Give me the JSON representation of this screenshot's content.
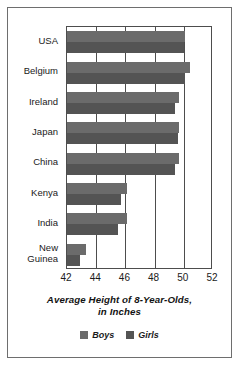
{
  "chart_data": {
    "type": "bar",
    "orientation": "horizontal",
    "title": "Average Height of 8-Year-Olds, in Inches",
    "title_line1": "Average Height of 8-Year-Olds,",
    "title_line2": "in Inches",
    "xlabel": "",
    "ylabel": "",
    "xlim": [
      42,
      52
    ],
    "xticks": [
      42,
      44,
      46,
      48,
      50,
      52
    ],
    "xtick_labels": [
      "42",
      "44",
      "46",
      "48",
      "50",
      "52"
    ],
    "grid": true,
    "grid_axis": "x",
    "legend_position": "bottom",
    "categories": [
      "USA",
      "Belgium",
      "Ireland",
      "Japan",
      "China",
      "Kenya",
      "India",
      "New\nGuinea"
    ],
    "category_labels": [
      "USA",
      "Belgium",
      "Ireland",
      "Japan",
      "China",
      "Kenya",
      "India",
      "New Guinea"
    ],
    "series": [
      {
        "name": "Boys",
        "color": "#6b6b6b",
        "values": [
          50.1,
          50.4,
          49.7,
          49.7,
          49.7,
          46.1,
          46.1,
          43.3
        ]
      },
      {
        "name": "Girls",
        "color": "#545454",
        "values": [
          50.0,
          50.1,
          49.4,
          49.6,
          49.4,
          45.7,
          45.5,
          42.9
        ]
      }
    ]
  },
  "legend": {
    "items": [
      {
        "label": "Boys",
        "color": "#6b6b6b"
      },
      {
        "label": "Girls",
        "color": "#545454"
      }
    ]
  },
  "colors": {
    "boys": "#6b6b6b",
    "girls": "#545454",
    "axis": "#4d4d4d",
    "frame": "#6e6e6e",
    "text": "#1a1a1a",
    "background": "#ffffff"
  }
}
